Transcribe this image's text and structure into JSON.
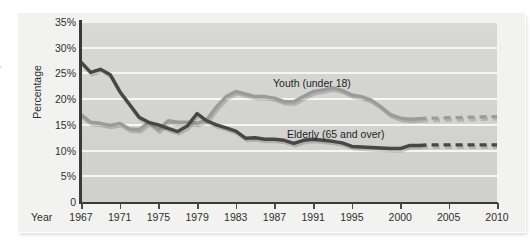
{
  "chart_data": {
    "type": "line",
    "title": "",
    "xlabel": "Year",
    "ylabel": "Percentage",
    "xlim": [
      1967,
      2010
    ],
    "ylim": [
      0,
      35
    ],
    "grid": true,
    "legend_position": "inline-labels",
    "x_tick_labels": [
      "1967",
      "1971",
      "1975",
      "1979",
      "1983",
      "1987",
      "1991",
      "1995",
      "2000",
      "2005",
      "2010"
    ],
    "x_tick_values": [
      1967,
      1971,
      1975,
      1979,
      1983,
      1987,
      1991,
      1995,
      2000,
      2005,
      2010
    ],
    "y_tick_labels": [
      "0",
      "5%",
      "10%",
      "15%",
      "20%",
      "25%",
      "30%",
      "35%"
    ],
    "y_tick_values": [
      0,
      5,
      10,
      15,
      20,
      25,
      30,
      35
    ],
    "series": [
      {
        "name": "Youth (under 18)",
        "label": "Youth (under 18)",
        "color": "#9b9b99",
        "x": [
          1967,
          1968,
          1969,
          1970,
          1971,
          1972,
          1973,
          1974,
          1975,
          1976,
          1977,
          1978,
          1979,
          1980,
          1981,
          1982,
          1983,
          1984,
          1985,
          1986,
          1987,
          1988,
          1989,
          1990,
          1991,
          1992,
          1993,
          1994,
          1995,
          1996,
          1997,
          1998,
          1999,
          2000,
          2001,
          2002
        ],
        "values": [
          17.0,
          15.5,
          15.3,
          14.9,
          15.3,
          14.2,
          14.1,
          15.5,
          14.0,
          15.8,
          15.5,
          15.5,
          15.3,
          16.0,
          18.5,
          20.5,
          21.5,
          21.0,
          20.5,
          20.5,
          20.2,
          19.5,
          19.5,
          20.5,
          21.5,
          21.8,
          22.2,
          21.7,
          20.8,
          20.5,
          19.8,
          18.5,
          17.0,
          16.3,
          16.1,
          16.2
        ],
        "projected_x": [
          2003,
          2004,
          2005,
          2006,
          2007,
          2008,
          2009,
          2010
        ],
        "projected_values": [
          16.3,
          16.3,
          16.4,
          16.4,
          16.5,
          16.5,
          16.6,
          16.6
        ],
        "projected_style": "dashed"
      },
      {
        "name": "Elderly (65 and over)",
        "label": "Elderly (65 and over)",
        "color": "#474747",
        "x": [
          1967,
          1968,
          1969,
          1970,
          1971,
          1972,
          1973,
          1974,
          1975,
          1976,
          1977,
          1978,
          1979,
          1980,
          1981,
          1982,
          1983,
          1984,
          1985,
          1986,
          1987,
          1988,
          1989,
          1990,
          1991,
          1992,
          1993,
          1994,
          1995,
          1996,
          1997,
          1998,
          1999,
          2000,
          2001,
          2002
        ],
        "values": [
          27.2,
          25.2,
          25.8,
          24.8,
          21.5,
          19.0,
          16.5,
          15.5,
          15.0,
          14.3,
          13.7,
          14.8,
          17.2,
          15.8,
          15.0,
          14.4,
          13.8,
          12.4,
          12.5,
          12.2,
          12.2,
          12.0,
          11.4,
          12.0,
          12.2,
          12.0,
          11.8,
          11.5,
          10.8,
          10.7,
          10.6,
          10.5,
          10.4,
          10.4,
          11.0,
          11.0
        ],
        "projected_x": [
          2003,
          2004,
          2005,
          2006,
          2007,
          2008,
          2009,
          2010
        ],
        "projected_values": [
          11.1,
          11.1,
          11.1,
          11.1,
          11.1,
          11.1,
          11.1,
          11.1
        ],
        "projected_style": "dashed"
      }
    ],
    "annotations": [
      {
        "text": "Youth (under 18)",
        "series": "Youth (under 18)"
      },
      {
        "text": "Elderly (65 and over)",
        "series": "Elderly (65 and over)"
      }
    ]
  },
  "margin_fragments": {
    "frag_1": "f",
    "frag_2": "y"
  }
}
